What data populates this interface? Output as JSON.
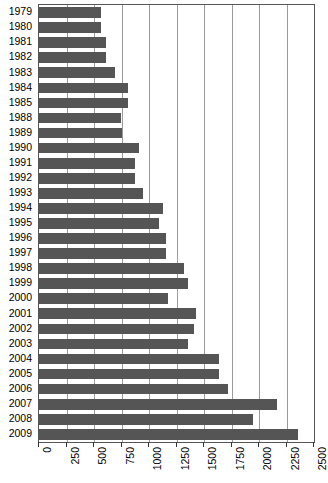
{
  "chart_data": {
    "type": "bar",
    "orientation": "horizontal",
    "title": "",
    "subtitle": "",
    "xlabel": "",
    "ylabel": "",
    "xlim": [
      0,
      2500
    ],
    "ylim": null,
    "grid": true,
    "legend": null,
    "legend_position": "none",
    "bar_color": "#555555",
    "axis_color": "#555555",
    "gridline_color": "#9a9a9a",
    "background_color": "#ffffff",
    "xticks": [
      0,
      250,
      500,
      750,
      1000,
      1250,
      1500,
      1750,
      2000,
      2250,
      2500
    ],
    "xtick_labels": [
      "0",
      "250",
      "500",
      "750",
      "1000",
      "1250",
      "1500",
      "1750",
      "2000",
      "2250",
      "2500"
    ],
    "categories": [
      "1979",
      "1980",
      "1981",
      "1982",
      "1983",
      "1984",
      "1985",
      "1988",
      "1989",
      "1990",
      "1991",
      "1992",
      "1993",
      "1994",
      "1995",
      "1996",
      "1997",
      "1998",
      "1999",
      "2000",
      "2001",
      "2002",
      "2003",
      "2004",
      "2005",
      "2006",
      "2007",
      "2008",
      "2009"
    ],
    "values": [
      560,
      560,
      610,
      605,
      690,
      810,
      805,
      745,
      755,
      910,
      875,
      870,
      945,
      1125,
      1090,
      1155,
      1150,
      1320,
      1350,
      1175,
      1425,
      1410,
      1350,
      1640,
      1640,
      1720,
      2160,
      1945,
      2355
    ],
    "annotations": []
  }
}
